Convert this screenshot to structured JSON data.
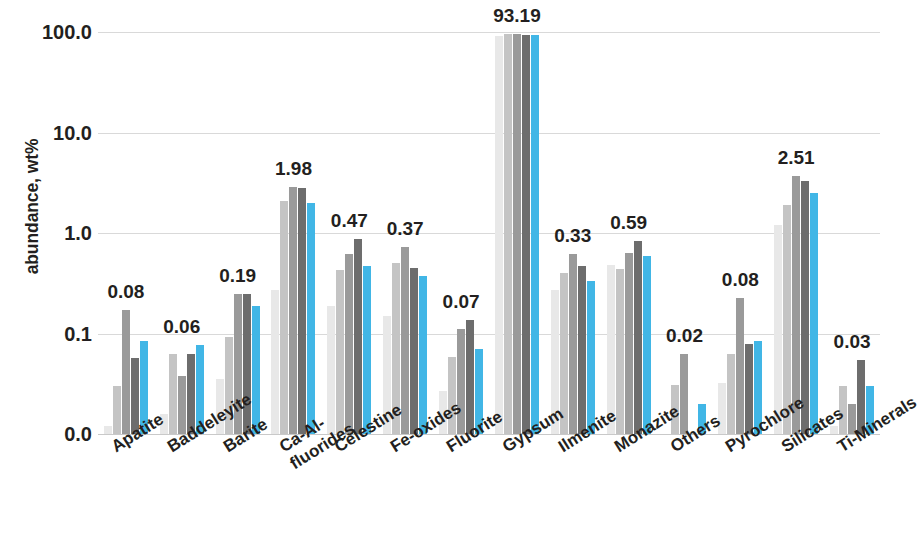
{
  "chart_data": {
    "type": "bar",
    "title": "",
    "xlabel": "",
    "ylabel": "abundance, wt%",
    "yscale": "log",
    "ylim": [
      0.01,
      100.0
    ],
    "ytick_labels": [
      "100.0",
      "10.0",
      "1.0",
      "0.1",
      "0.0"
    ],
    "ytick_values": [
      100.0,
      10.0,
      1.0,
      0.1,
      0.01
    ],
    "grid": true,
    "legend": "none",
    "series": [
      {
        "name": "series-1",
        "color": "#e8e8e8"
      },
      {
        "name": "series-2",
        "color": "#c4c4c4"
      },
      {
        "name": "series-3",
        "color": "#9a9a9a"
      },
      {
        "name": "series-4",
        "color": "#6d6d6d"
      },
      {
        "name": "series-5",
        "color": "#41b6e6"
      }
    ],
    "categories": [
      "Apatite",
      "Baddeleyite",
      "Barite",
      "Ca-Al-fluorides",
      "Celestine",
      "Fe-oxides",
      "Fluorite",
      "Gypsum",
      "Ilmenite",
      "Monazite",
      "Others",
      "Pyrochlore",
      "Silicates",
      "Ti-Minerals"
    ],
    "category_label_lines": [
      [
        "Apatite",
        ""
      ],
      [
        "Baddeleyite",
        ""
      ],
      [
        "Barite",
        ""
      ],
      [
        "Ca-Al-",
        "fluorides"
      ],
      [
        "Celestine",
        ""
      ],
      [
        "Fe-oxides",
        ""
      ],
      [
        "Fluorite",
        ""
      ],
      [
        "Gypsum",
        ""
      ],
      [
        "Ilmenite",
        ""
      ],
      [
        "Monazite",
        ""
      ],
      [
        "Others",
        ""
      ],
      [
        "Pyrochlore",
        ""
      ],
      [
        "Silicates",
        ""
      ],
      [
        "Ti-Minerals",
        ""
      ]
    ],
    "group_labels": [
      "0.08",
      "0.06",
      "0.19",
      "1.98",
      "0.47",
      "0.37",
      "0.07",
      "93.19",
      "0.33",
      "0.59",
      "0.02",
      "0.08",
      "2.51",
      "0.03"
    ],
    "values": [
      [
        0.012,
        0.03,
        0.17,
        0.057,
        0.085
      ],
      [
        0.016,
        0.063,
        0.038,
        0.063,
        0.077
      ],
      [
        0.035,
        0.093,
        0.25,
        0.25,
        0.19
      ],
      [
        0.27,
        2.1,
        2.9,
        2.8,
        1.98
      ],
      [
        0.19,
        0.43,
        0.62,
        0.88,
        0.47
      ],
      [
        0.15,
        0.5,
        0.72,
        0.45,
        0.37
      ],
      [
        0.027,
        0.058,
        0.11,
        0.135,
        0.07
      ],
      [
        92.0,
        95.0,
        96.0,
        94.0,
        93.19
      ],
      [
        0.27,
        0.4,
        0.62,
        0.47,
        0.33
      ],
      [
        0.48,
        0.44,
        0.63,
        0.83,
        0.59
      ],
      [
        0.006,
        0.031,
        0.062,
        0.009,
        0.02
      ],
      [
        0.032,
        0.063,
        0.225,
        0.078,
        0.085
      ],
      [
        1.2,
        1.9,
        3.7,
        3.3,
        2.51
      ],
      [
        0.012,
        0.03,
        0.02,
        0.054,
        0.03
      ]
    ]
  }
}
